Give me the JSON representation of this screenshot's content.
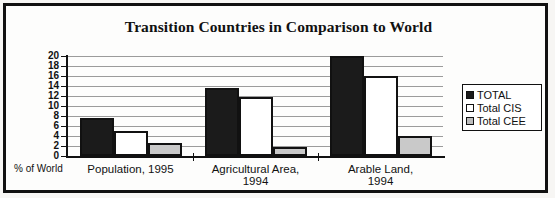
{
  "figure": {
    "title": "Transition Countries in Comparison to World",
    "axis_caption": "% of World"
  },
  "legend": {
    "items": [
      {
        "label": "TOTAL",
        "swatch": "legend-swatch-total",
        "color": "#1b1b1b"
      },
      {
        "label": "Total CIS",
        "swatch": "legend-swatch-total-cis",
        "color": "#ffffff"
      },
      {
        "label": "Total CEE",
        "swatch": "legend-swatch-total-cee",
        "color": "#bdbdbd"
      }
    ]
  },
  "yaxis": {
    "ticks": [
      "20",
      "18",
      "16",
      "14",
      "12",
      "10",
      "8",
      "6",
      "4",
      "2",
      "0"
    ]
  },
  "categories": [
    {
      "line1": "Population, 1995",
      "line2": ""
    },
    {
      "line1": "Agricultural Area,",
      "line2": "1994"
    },
    {
      "line1": "Arable Land,",
      "line2": "1994"
    }
  ],
  "chart_data": {
    "type": "bar",
    "title": "Transition Countries in Comparison to World",
    "xlabel": "% of World",
    "ylabel": "% of World",
    "ylim": [
      0,
      20
    ],
    "ytick_step": 2,
    "grid": true,
    "legend_position": "right",
    "categories": [
      "Population, 1995",
      "Agricultural Area, 1994",
      "Arable Land, 1994"
    ],
    "series": [
      {
        "name": "TOTAL",
        "color": "#1b1b1b",
        "values": [
          7.6,
          13.6,
          20.0
        ]
      },
      {
        "name": "Total CIS",
        "color": "#ffffff",
        "values": [
          5.0,
          11.8,
          16.1
        ]
      },
      {
        "name": "Total CEE",
        "color": "#c9c9c9",
        "values": [
          2.6,
          1.8,
          4.1
        ]
      }
    ]
  }
}
